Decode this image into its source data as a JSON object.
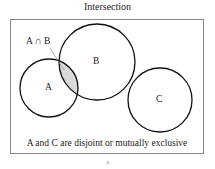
{
  "diagram": {
    "title": "Intersection",
    "caption": "A and C are disjoint or mutually exclusive",
    "intersection_label": "A ∩ B",
    "footer_mark": "a",
    "sets": [
      {
        "label": "A",
        "cx": 49,
        "cy": 88,
        "r": 29
      },
      {
        "label": "B",
        "cx": 97,
        "cy": 62,
        "r": 38
      },
      {
        "label": "C",
        "cx": 160,
        "cy": 100,
        "r": 32
      }
    ],
    "shaded_region": "A ∩ B",
    "colors": {
      "shade": "#d9d9d9",
      "stroke": "#111111",
      "frame": "#888888"
    }
  }
}
